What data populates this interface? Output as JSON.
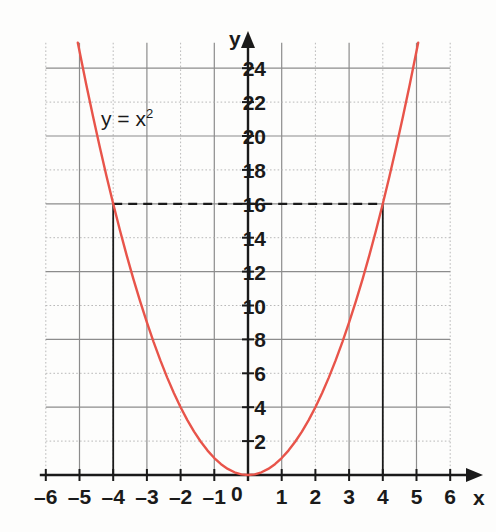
{
  "chart_data": {
    "type": "line",
    "title": "",
    "subtitle": "",
    "xlabel": "x",
    "ylabel": "y",
    "annotation": "y = x",
    "annotation_exponent": "2",
    "equation": "y = x^2",
    "origin_label": "0",
    "xlim": [
      -6.5,
      6.5
    ],
    "ylim": [
      0,
      25.5
    ],
    "x_ticks": [
      -6,
      -5,
      -4,
      -3,
      -2,
      -1,
      0,
      1,
      2,
      3,
      4,
      5,
      6
    ],
    "x_tick_labels": [
      "–6",
      "–5",
      "–4",
      "–3",
      "–2",
      "–1",
      "0",
      "1",
      "2",
      "3",
      "4",
      "5",
      "6"
    ],
    "y_ticks": [
      2,
      4,
      6,
      8,
      10,
      12,
      14,
      16,
      18,
      20,
      22,
      24
    ],
    "y_tick_labels": [
      "2",
      "4",
      "6",
      "8",
      "10",
      "12",
      "14",
      "16",
      "18",
      "20",
      "22",
      "24"
    ],
    "grid": true,
    "grid_major_step_x": 1,
    "grid_major_step_y": 2,
    "legend": false,
    "series": [
      {
        "name": "y = x^2",
        "color": "#e8544a",
        "x": [
          -5.05,
          -4.8,
          -4.6,
          -4.4,
          -4.2,
          -4,
          -3.8,
          -3.6,
          -3.4,
          -3.2,
          -3,
          -2.8,
          -2.6,
          -2.4,
          -2.2,
          -2,
          -1.8,
          -1.6,
          -1.4,
          -1.2,
          -1,
          -0.8,
          -0.6,
          -0.4,
          -0.2,
          0,
          0.2,
          0.4,
          0.6,
          0.8,
          1,
          1.2,
          1.4,
          1.6,
          1.8,
          2,
          2.2,
          2.4,
          2.6,
          2.8,
          3,
          3.2,
          3.4,
          3.6,
          3.8,
          4,
          4.2,
          4.4,
          4.6,
          4.8,
          5.05
        ],
        "y": [
          25.5,
          23.04,
          21.16,
          19.36,
          17.64,
          16,
          14.44,
          12.96,
          11.56,
          10.24,
          9,
          7.84,
          6.76,
          5.76,
          4.84,
          4,
          3.24,
          2.56,
          1.96,
          1.44,
          1,
          0.64,
          0.36,
          0.16,
          0.04,
          0,
          0.04,
          0.16,
          0.36,
          0.64,
          1,
          1.44,
          1.96,
          2.56,
          3.24,
          4,
          4.84,
          5.76,
          6.76,
          7.84,
          9,
          10.24,
          11.56,
          12.96,
          14.44,
          16,
          17.64,
          19.36,
          21.16,
          23.04,
          25.5
        ]
      }
    ],
    "construction_lines": [
      {
        "name": "horizontal-dashed-y16",
        "type": "horizontal-dashed",
        "y": 16,
        "x_from": -4,
        "x_to": 4,
        "color": "#1a1a1a"
      },
      {
        "name": "vertical-drop-x-neg4",
        "type": "vertical-solid",
        "x": -4,
        "y_from": 0,
        "y_to": 16,
        "color": "#1a1a1a"
      },
      {
        "name": "vertical-drop-x-pos4",
        "type": "vertical-solid",
        "x": 4,
        "y_from": 0,
        "y_to": 16,
        "color": "#1a1a1a"
      }
    ],
    "marked_points": [
      {
        "x": -4,
        "y": 16
      },
      {
        "x": 4,
        "y": 16
      }
    ],
    "colors": {
      "curve": "#e8544a",
      "axis": "#1a1a1a",
      "grid_major": "#8c8c8c",
      "grid_minor": "#b9b9b9",
      "background": "#fdfdfc",
      "text": "#1a1a1a"
    }
  }
}
